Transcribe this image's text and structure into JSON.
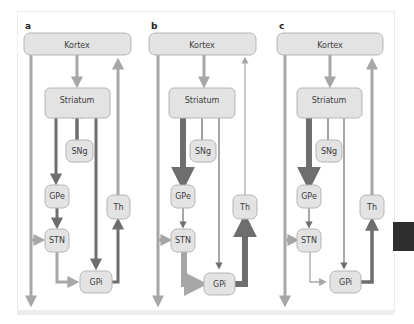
{
  "figure": {
    "panels": [
      {
        "id": "a",
        "label": "a",
        "nodes": {
          "kortex": "Kortex",
          "striatum": "Striatum",
          "sng": "SNg",
          "gpe": "GPe",
          "stn": "STN",
          "gpi": "GPi",
          "th": "Th"
        },
        "edges": [
          {
            "from": "Kortex",
            "to": "Striatum",
            "weight": "normal",
            "color": "#a7a7a7"
          },
          {
            "from": "SNg",
            "to": "Striatum",
            "weight": "thick",
            "color": "#6e6e6e",
            "note": "bidirectional arrow inside striatum (dark left, light right)"
          },
          {
            "from": "Striatum",
            "to": "GPe",
            "weight": "thick",
            "color": "#6e6e6e"
          },
          {
            "from": "Striatum",
            "to": "GPi",
            "weight": "thick",
            "color": "#6e6e6e"
          },
          {
            "from": "GPe",
            "to": "STN",
            "weight": "thick",
            "color": "#6e6e6e"
          },
          {
            "from": "Kortex",
            "to": "STN",
            "weight": "normal",
            "color": "#a7a7a7"
          },
          {
            "from": "STN",
            "to": "GPi",
            "weight": "normal",
            "color": "#a7a7a7"
          },
          {
            "from": "GPi",
            "to": "Th",
            "weight": "thick",
            "color": "#6e6e6e"
          },
          {
            "from": "Th",
            "to": "Kortex",
            "weight": "normal",
            "color": "#a7a7a7"
          },
          {
            "from": "Kortex",
            "to": "output",
            "weight": "normal",
            "color": "#a7a7a7"
          }
        ]
      },
      {
        "id": "b",
        "label": "b",
        "nodes": {
          "kortex": "Kortex",
          "striatum": "Striatum",
          "sng": "SNg",
          "gpe": "GPe",
          "stn": "STN",
          "gpi": "GPi",
          "th": "Th"
        },
        "edges": [
          {
            "from": "Kortex",
            "to": "Striatum",
            "weight": "normal",
            "color": "#a7a7a7"
          },
          {
            "from": "SNg",
            "to": "Striatum",
            "weight": "thin",
            "color": "#6e6e6e"
          },
          {
            "from": "Striatum",
            "to": "GPe",
            "weight": "very-thick",
            "color": "#6e6e6e"
          },
          {
            "from": "Striatum",
            "to": "GPi",
            "weight": "thin",
            "color": "#6e6e6e"
          },
          {
            "from": "GPe",
            "to": "STN",
            "weight": "thin",
            "color": "#6e6e6e"
          },
          {
            "from": "Kortex",
            "to": "STN",
            "weight": "normal",
            "color": "#a7a7a7"
          },
          {
            "from": "STN",
            "to": "GPi",
            "weight": "very-thick",
            "color": "#a7a7a7"
          },
          {
            "from": "GPi",
            "to": "Th",
            "weight": "very-thick",
            "color": "#6e6e6e"
          },
          {
            "from": "Th",
            "to": "Kortex",
            "weight": "thin",
            "color": "#a7a7a7"
          },
          {
            "from": "Kortex",
            "to": "output",
            "weight": "normal",
            "color": "#a7a7a7"
          }
        ]
      },
      {
        "id": "c",
        "label": "c",
        "nodes": {
          "kortex": "Kortex",
          "striatum": "Striatum",
          "sng": "SNg",
          "gpe": "GPe",
          "stn": "STN",
          "gpi": "GPi",
          "th": "Th"
        },
        "edges": [
          {
            "from": "Kortex",
            "to": "Striatum",
            "weight": "normal",
            "color": "#a7a7a7"
          },
          {
            "from": "SNg",
            "to": "Striatum",
            "weight": "thin",
            "color": "#6e6e6e"
          },
          {
            "from": "Striatum",
            "to": "GPe",
            "weight": "very-thick",
            "color": "#6e6e6e"
          },
          {
            "from": "Striatum",
            "to": "GPi",
            "weight": "thin",
            "color": "#6e6e6e"
          },
          {
            "from": "GPe",
            "to": "STN",
            "weight": "thin",
            "color": "#6e6e6e"
          },
          {
            "from": "Kortex",
            "to": "STN",
            "weight": "normal",
            "color": "#a7a7a7"
          },
          {
            "from": "STN",
            "to": "GPi",
            "weight": "thin",
            "color": "#a7a7a7"
          },
          {
            "from": "GPi",
            "to": "Th",
            "weight": "thick",
            "color": "#6e6e6e"
          },
          {
            "from": "Th",
            "to": "Kortex",
            "weight": "thick",
            "color": "#a7a7a7"
          },
          {
            "from": "Kortex",
            "to": "output",
            "weight": "normal",
            "color": "#a7a7a7"
          }
        ]
      }
    ],
    "colors": {
      "node_fill": "#e3e3e3",
      "node_stroke": "#b5b5b5",
      "light_arrow": "#a7a7a7",
      "dark_arrow": "#6e6e6e",
      "text": "#3c3c3c"
    }
  }
}
